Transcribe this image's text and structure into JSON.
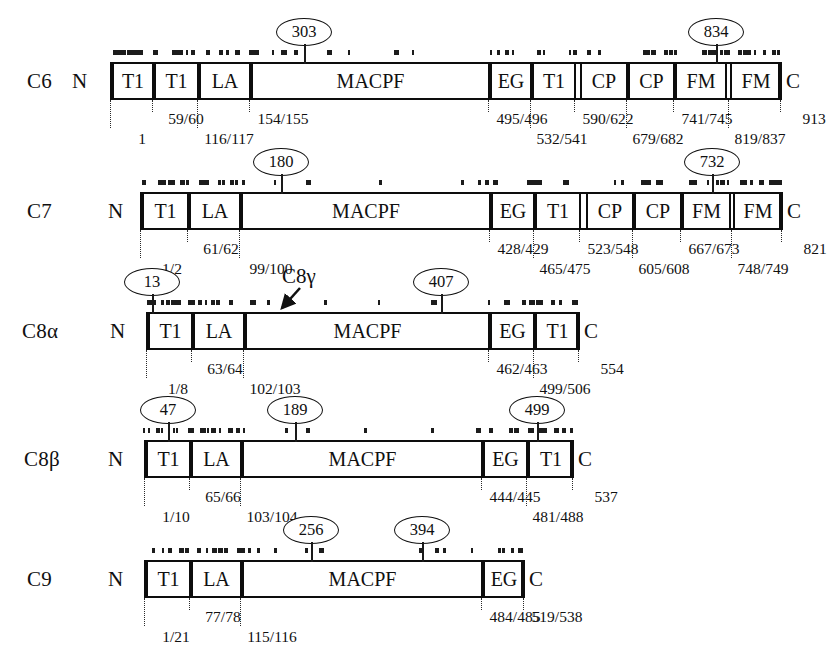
{
  "figure": {
    "n_terminus_label": "N",
    "c_terminus_label": "C",
    "annotation_c8g": "C8γ"
  },
  "chart_data": {
    "type": "diagram",
    "xlabel": "Residue number",
    "ylabel": "",
    "proteins": [
      {
        "name": "C6",
        "length": 913,
        "domains": [
          {
            "label": "T1",
            "start": 1,
            "end": 59
          },
          {
            "label": "T1",
            "start": 60,
            "end": 116
          },
          {
            "label": "LA",
            "start": 117,
            "end": 154
          },
          {
            "label": "MACPF",
            "start": 155,
            "end": 495
          },
          {
            "label": "EG",
            "start": 496,
            "end": 532
          },
          {
            "label": "T1",
            "start": 541,
            "end": 590
          },
          {
            "label": "CP",
            "start": 622,
            "end": 679
          },
          {
            "label": "CP",
            "start": 682,
            "end": 741
          },
          {
            "label": "FM",
            "start": 745,
            "end": 819
          },
          {
            "label": "FM",
            "start": 837,
            "end": 913
          }
        ],
        "boundary_labels_upper": [
          "59/60",
          "154/155",
          "495/496",
          "590/622",
          "741/745",
          "913"
        ],
        "boundary_labels_lower": [
          "1",
          "116/117",
          "532/541",
          "679/682",
          "819/837"
        ],
        "glycosylation_sites": [
          303,
          834
        ]
      },
      {
        "name": "C7",
        "length": 821,
        "domains": [
          {
            "label": "T1",
            "start": 1,
            "end": 61
          },
          {
            "label": "LA",
            "start": 62,
            "end": 99
          },
          {
            "label": "MACPF",
            "start": 100,
            "end": 428
          },
          {
            "label": "EG",
            "start": 429,
            "end": 465
          },
          {
            "label": "T1",
            "start": 475,
            "end": 523
          },
          {
            "label": "CP",
            "start": 548,
            "end": 605
          },
          {
            "label": "CP",
            "start": 608,
            "end": 667
          },
          {
            "label": "FM",
            "start": 673,
            "end": 748
          },
          {
            "label": "FM",
            "start": 749,
            "end": 821
          }
        ],
        "boundary_labels_upper": [
          "61/62",
          "428/429",
          "523/548",
          "667/673",
          "821"
        ],
        "boundary_labels_lower": [
          "1/2",
          "99/100",
          "465/475",
          "605/608",
          "748/749"
        ],
        "glycosylation_sites": [
          180,
          732
        ]
      },
      {
        "name": "C8α",
        "length": 554,
        "domains": [
          {
            "label": "T1",
            "start": 8,
            "end": 63
          },
          {
            "label": "LA",
            "start": 64,
            "end": 102
          },
          {
            "label": "MACPF",
            "start": 103,
            "end": 462
          },
          {
            "label": "EG",
            "start": 463,
            "end": 499
          },
          {
            "label": "T1",
            "start": 506,
            "end": 554
          }
        ],
        "boundary_labels_upper": [
          "63/64",
          "462/463",
          "554"
        ],
        "boundary_labels_lower": [
          "1/8",
          "102/103",
          "499/506"
        ],
        "glycosylation_sites": [
          13,
          407
        ],
        "annotation": {
          "text": "C8γ",
          "residue": 230
        }
      },
      {
        "name": "C8β",
        "length": 537,
        "domains": [
          {
            "label": "T1",
            "start": 10,
            "end": 65
          },
          {
            "label": "LA",
            "start": 66,
            "end": 103
          },
          {
            "label": "MACPF",
            "start": 104,
            "end": 444
          },
          {
            "label": "EG",
            "start": 445,
            "end": 481
          },
          {
            "label": "T1",
            "start": 488,
            "end": 537
          }
        ],
        "boundary_labels_upper": [
          "65/66",
          "444/445",
          "537"
        ],
        "boundary_labels_lower": [
          "1/10",
          "103/104",
          "481/488"
        ],
        "glycosylation_sites": [
          47,
          189,
          499
        ]
      },
      {
        "name": "C9",
        "length": 538,
        "domains": [
          {
            "label": "T1",
            "start": 21,
            "end": 77
          },
          {
            "label": "LA",
            "start": 78,
            "end": 115
          },
          {
            "label": "MACPF",
            "start": 116,
            "end": 484
          },
          {
            "label": "EG",
            "start": 485,
            "end": 519
          }
        ],
        "boundary_labels_upper": [
          "77/78",
          "484/485",
          "519/538"
        ],
        "boundary_labels_lower": [
          "1/21",
          "115/116"
        ],
        "glycosylation_sites": [
          256,
          394
        ]
      }
    ],
    "domain_legend": {
      "T1": "Thrombospondin type 1 repeat",
      "LA": "LDL receptor class A",
      "MACPF": "Membrane attack complex / perforin domain",
      "EG": "EGF-like domain",
      "CP": "Complement control protein (CCP/SCR)",
      "FM": "Factor I membrane attack complex domain"
    }
  },
  "rows": [
    {
      "name": "C6",
      "n": "N",
      "c": "C",
      "boxes": [
        {
          "label": "T1",
          "x": 110,
          "w": 42
        },
        {
          "label": "T1",
          "x": 152,
          "w": 45
        },
        {
          "label": "LA",
          "x": 197,
          "w": 52
        },
        {
          "label": "MACPF",
          "x": 249,
          "w": 239
        },
        {
          "label": "EG",
          "x": 488,
          "w": 42
        },
        {
          "label": "T1",
          "x": 530,
          "w": 44
        },
        {
          "label": "CP",
          "x": 578,
          "w": 48
        },
        {
          "label": "CP",
          "x": 626,
          "w": 47
        },
        {
          "label": "FM",
          "x": 673,
          "w": 52
        },
        {
          "label": "FM",
          "x": 728,
          "w": 52
        }
      ],
      "ticks_upper": [
        {
          "x": 152,
          "text": "59/60"
        },
        {
          "x": 249,
          "text": "154/155"
        },
        {
          "x": 488,
          "text": "495/496"
        },
        {
          "x": 574,
          "text": "590/622"
        },
        {
          "x": 673,
          "text": "741/745"
        },
        {
          "x": 780,
          "text": "913"
        }
      ],
      "ticks_lower": [
        {
          "x": 110,
          "text": "1"
        },
        {
          "x": 197,
          "text": "116/117"
        },
        {
          "x": 530,
          "text": "532/541"
        },
        {
          "x": 626,
          "text": "679/682"
        },
        {
          "x": 728,
          "text": "819/837"
        }
      ],
      "callouts": [
        {
          "x": 304,
          "text": "303"
        },
        {
          "x": 716,
          "text": "834"
        }
      ]
    },
    {
      "name": "C7",
      "n": "N",
      "c": "C",
      "boxes": [
        {
          "label": "T1",
          "x": 140,
          "w": 47
        },
        {
          "label": "LA",
          "x": 187,
          "w": 52
        },
        {
          "label": "MACPF",
          "x": 239,
          "w": 250
        },
        {
          "label": "EG",
          "x": 489,
          "w": 44
        },
        {
          "label": "T1",
          "x": 533,
          "w": 46
        },
        {
          "label": "CP",
          "x": 584,
          "w": 48
        },
        {
          "label": "CP",
          "x": 632,
          "w": 48
        },
        {
          "label": "FM",
          "x": 680,
          "w": 49
        },
        {
          "label": "FM",
          "x": 731,
          "w": 50
        }
      ],
      "ticks_upper": [
        {
          "x": 187,
          "text": "61/62"
        },
        {
          "x": 489,
          "text": "428/429"
        },
        {
          "x": 579,
          "text": "523/548"
        },
        {
          "x": 680,
          "text": "667/673"
        },
        {
          "x": 781,
          "text": "821"
        }
      ],
      "ticks_lower": [
        {
          "x": 140,
          "text": "1/2"
        },
        {
          "x": 239,
          "text": "99/100"
        },
        {
          "x": 533,
          "text": "465/475"
        },
        {
          "x": 632,
          "text": "605/608"
        },
        {
          "x": 731,
          "text": "748/749"
        }
      ],
      "callouts": [
        {
          "x": 281,
          "text": "180"
        },
        {
          "x": 712,
          "text": "732"
        }
      ]
    },
    {
      "name": "C8α",
      "n": "N",
      "c": "C",
      "boxes": [
        {
          "label": "T1",
          "x": 146,
          "w": 45
        },
        {
          "label": "LA",
          "x": 191,
          "w": 52
        },
        {
          "label": "MACPF",
          "x": 243,
          "w": 245
        },
        {
          "label": "EG",
          "x": 488,
          "w": 45
        },
        {
          "label": "T1",
          "x": 533,
          "w": 45
        }
      ],
      "ticks_upper": [
        {
          "x": 191,
          "text": "63/64"
        },
        {
          "x": 488,
          "text": "462/463"
        },
        {
          "x": 578,
          "text": "554"
        }
      ],
      "ticks_lower": [
        {
          "x": 146,
          "text": "1/8"
        },
        {
          "x": 243,
          "text": "102/103"
        },
        {
          "x": 533,
          "text": "499/506"
        }
      ],
      "callouts": [
        {
          "x": 152,
          "text": "13"
        },
        {
          "x": 441,
          "text": "407"
        }
      ],
      "annotation": {
        "x": 300,
        "text": "C8γ"
      }
    },
    {
      "name": "C8β",
      "n": "N",
      "c": "C",
      "boxes": [
        {
          "label": "T1",
          "x": 144,
          "w": 45
        },
        {
          "label": "LA",
          "x": 189,
          "w": 51
        },
        {
          "label": "MACPF",
          "x": 240,
          "w": 241
        },
        {
          "label": "EG",
          "x": 481,
          "w": 45
        },
        {
          "label": "T1",
          "x": 526,
          "w": 46
        }
      ],
      "ticks_upper": [
        {
          "x": 189,
          "text": "65/66"
        },
        {
          "x": 481,
          "text": "444/445"
        },
        {
          "x": 572,
          "text": "537"
        }
      ],
      "ticks_lower": [
        {
          "x": 144,
          "text": "1/10"
        },
        {
          "x": 240,
          "text": "103/104"
        },
        {
          "x": 526,
          "text": "481/488"
        }
      ],
      "callouts": [
        {
          "x": 168,
          "text": "47"
        },
        {
          "x": 295,
          "text": "189"
        },
        {
          "x": 537,
          "text": "499"
        }
      ]
    },
    {
      "name": "C9",
      "n": "N",
      "c": "C",
      "boxes": [
        {
          "label": "T1",
          "x": 144,
          "w": 45
        },
        {
          "label": "LA",
          "x": 189,
          "w": 51
        },
        {
          "label": "MACPF",
          "x": 240,
          "w": 241
        },
        {
          "label": "EG",
          "x": 481,
          "w": 42
        }
      ],
      "ticks_upper": [
        {
          "x": 189,
          "text": "77/78"
        },
        {
          "x": 481,
          "text": "484/485"
        },
        {
          "x": 523,
          "text": "519/538"
        }
      ],
      "ticks_lower": [
        {
          "x": 144,
          "text": "1/21"
        },
        {
          "x": 240,
          "text": "115/116"
        }
      ],
      "callouts": [
        {
          "x": 311,
          "text": "256"
        },
        {
          "x": 422,
          "text": "394"
        }
      ]
    }
  ]
}
